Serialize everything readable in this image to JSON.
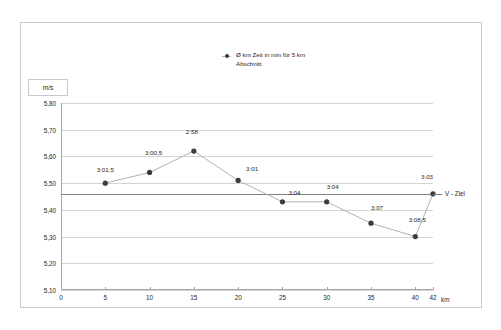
{
  "legend": {
    "label": "Ø km Zeit in min für 5 km Abschnitt",
    "marker_color": "#3c3c3c",
    "line_color": "#b2b2b2"
  },
  "axes": {
    "y_unit": "m/s",
    "x_title": "km"
  },
  "target": {
    "label": "V - Ziel",
    "value": 5.46,
    "color": "#808080"
  },
  "chart_data": {
    "type": "line",
    "title": "",
    "subtitle": "",
    "xlabel": "km",
    "ylabel": "m/s",
    "xlim": [
      0,
      42
    ],
    "ylim": [
      5.1,
      5.8
    ],
    "grid": true,
    "legend_position": "top-center",
    "x_ticks": [
      0,
      5,
      10,
      15,
      20,
      25,
      30,
      35,
      40,
      42
    ],
    "x_tick_labels": [
      "0",
      "5",
      "10",
      "15",
      "20",
      "25",
      "30",
      "35",
      "40",
      "42"
    ],
    "y_ticks": [
      5.1,
      5.2,
      5.3,
      5.4,
      5.5,
      5.6,
      5.7,
      5.8
    ],
    "y_tick_labels": [
      "5,10",
      "5,20",
      "5,30",
      "5,40",
      "5,50",
      "5,60",
      "5,70",
      "5,80"
    ],
    "series": [
      {
        "name": "Ø km Zeit in min für 5 km Abschnitt",
        "x": [
          5,
          10,
          15,
          20,
          25,
          30,
          35,
          40,
          42
        ],
        "values": [
          5.5,
          5.54,
          5.62,
          5.51,
          5.43,
          5.43,
          5.35,
          5.3,
          5.46
        ],
        "point_labels": [
          "3:01,5",
          "3:00,5",
          "2:58",
          "3:01",
          "3:04",
          "3:04",
          "3:07",
          "3:08,5",
          "3:03"
        ],
        "label_offsets": [
          {
            "dx": 0,
            "dy": -10
          },
          {
            "dx": 4,
            "dy": -16
          },
          {
            "dx": -2,
            "dy": -16
          },
          {
            "dx": 14,
            "dy": -8
          },
          {
            "dx": 12,
            "dy": -6
          },
          {
            "dx": 6,
            "dy": -12
          },
          {
            "dx": 6,
            "dy": -12
          },
          {
            "dx": 2,
            "dy": -14
          },
          {
            "dx": -6,
            "dy": -14
          }
        ]
      }
    ],
    "annotations": [
      {
        "text": "V - Ziel",
        "type": "hline",
        "y": 5.46
      }
    ]
  }
}
